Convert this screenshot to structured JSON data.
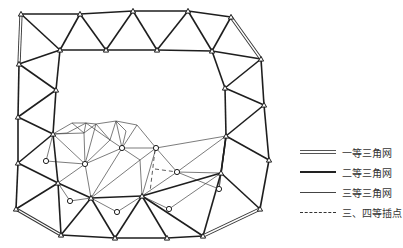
{
  "diagram": {
    "type": "triangulation network",
    "colors": {
      "line": "#222222",
      "background": "#ffffff"
    }
  },
  "legend": {
    "items": [
      {
        "key": "first",
        "label": "一等三角网",
        "style": "double"
      },
      {
        "key": "second",
        "label": "二等三角网",
        "style": "thick"
      },
      {
        "key": "third",
        "label": "三等三角网",
        "style": "thin"
      },
      {
        "key": "fourth",
        "label": "三、四等插点",
        "style": "dashed"
      }
    ]
  },
  "network": {
    "nodes": {
      "A": [
        21,
        14
      ],
      "B": [
        80,
        14
      ],
      "C": [
        133,
        11
      ],
      "D": [
        188,
        11
      ],
      "E": [
        231,
        17
      ],
      "F": [
        60,
        50
      ],
      "G": [
        106,
        50
      ],
      "H": [
        157,
        50
      ],
      "I": [
        212,
        51
      ],
      "J": [
        19,
        64
      ],
      "K": [
        261,
        59
      ],
      "L": [
        56,
        90
      ],
      "M": [
        225,
        88
      ],
      "N": [
        18,
        117
      ],
      "O": [
        264,
        105
      ],
      "P": [
        53,
        134
      ],
      "Q": [
        226,
        136
      ],
      "R": [
        18,
        163
      ],
      "S": [
        269,
        160
      ],
      "T": [
        58,
        183
      ],
      "U": [
        221,
        173
      ],
      "V": [
        91,
        198
      ],
      "W": [
        142,
        196
      ],
      "X": [
        16,
        209
      ],
      "Y": [
        260,
        209
      ],
      "Z": [
        61,
        235
      ],
      "AA": [
        115,
        238
      ],
      "AB": [
        167,
        238
      ],
      "AC": [
        203,
        236
      ],
      "f1": [
        72,
        123
      ],
      "f2": [
        86,
        123
      ],
      "f3": [
        96,
        124
      ],
      "f4": [
        116,
        121
      ],
      "f5": [
        137,
        125
      ],
      "f6": [
        84,
        133
      ],
      "f7": [
        85,
        164
      ],
      "f8": [
        122,
        148
      ],
      "f9": [
        156,
        148
      ],
      "f10": [
        177,
        172
      ],
      "f11": [
        67,
        133
      ],
      "f12": [
        126,
        131
      ],
      "f13": [
        110,
        140
      ],
      "f14": [
        140,
        160
      ]
    },
    "interpolated_points": {
      "c1": [
        46,
        161
      ],
      "c2": [
        70,
        201
      ],
      "c3": [
        117,
        212
      ],
      "c4": [
        169,
        209
      ],
      "c5": [
        219,
        189
      ],
      "c6": [
        177,
        172
      ],
      "c7": [
        122,
        148
      ],
      "c8": [
        85,
        164
      ],
      "c9": [
        156,
        148
      ]
    },
    "first_order_edges": [
      [
        "A",
        "J"
      ],
      [
        "E",
        "K"
      ],
      [
        "X",
        "Z"
      ],
      [
        "Y",
        "AC"
      ]
    ],
    "second_order_edges": [
      [
        "A",
        "B"
      ],
      [
        "B",
        "C"
      ],
      [
        "C",
        "D"
      ],
      [
        "D",
        "E"
      ],
      [
        "A",
        "F"
      ],
      [
        "B",
        "F"
      ],
      [
        "B",
        "G"
      ],
      [
        "C",
        "G"
      ],
      [
        "C",
        "H"
      ],
      [
        "D",
        "H"
      ],
      [
        "D",
        "I"
      ],
      [
        "E",
        "I"
      ],
      [
        "F",
        "G"
      ],
      [
        "G",
        "H"
      ],
      [
        "H",
        "I"
      ],
      [
        "I",
        "K"
      ],
      [
        "I",
        "M"
      ],
      [
        "K",
        "M"
      ],
      [
        "K",
        "O"
      ],
      [
        "M",
        "O"
      ],
      [
        "J",
        "F"
      ],
      [
        "F",
        "L"
      ],
      [
        "J",
        "L"
      ],
      [
        "J",
        "N"
      ],
      [
        "L",
        "N"
      ],
      [
        "L",
        "P"
      ],
      [
        "N",
        "P"
      ],
      [
        "N",
        "R"
      ],
      [
        "P",
        "R"
      ],
      [
        "M",
        "Q"
      ],
      [
        "O",
        "Q"
      ],
      [
        "O",
        "S"
      ],
      [
        "Q",
        "S"
      ],
      [
        "Q",
        "U"
      ],
      [
        "S",
        "Y"
      ],
      [
        "U",
        "Y"
      ],
      [
        "R",
        "T"
      ],
      [
        "P",
        "T"
      ],
      [
        "R",
        "X"
      ],
      [
        "T",
        "X"
      ],
      [
        "T",
        "Z"
      ],
      [
        "T",
        "V"
      ],
      [
        "V",
        "Z"
      ],
      [
        "V",
        "AA"
      ],
      [
        "Z",
        "AA"
      ],
      [
        "V",
        "W"
      ],
      [
        "W",
        "AA"
      ],
      [
        "W",
        "AB"
      ],
      [
        "AA",
        "AB"
      ],
      [
        "W",
        "U"
      ],
      [
        "U",
        "AC"
      ],
      [
        "AB",
        "AC"
      ],
      [
        "W",
        "AC"
      ],
      [
        "U",
        "Q"
      ]
    ],
    "third_order_edges": [
      [
        "P",
        "f1"
      ],
      [
        "f1",
        "f2"
      ],
      [
        "f2",
        "f3"
      ],
      [
        "f3",
        "f4"
      ],
      [
        "f4",
        "f5"
      ],
      [
        "f5",
        "f9"
      ],
      [
        "f9",
        "f10"
      ],
      [
        "f10",
        "Q"
      ],
      [
        "P",
        "f6"
      ],
      [
        "f1",
        "f6"
      ],
      [
        "f2",
        "f6"
      ],
      [
        "f6",
        "f3"
      ],
      [
        "f3",
        "f13"
      ],
      [
        "f6",
        "f7"
      ],
      [
        "P",
        "f7"
      ],
      [
        "P",
        "c1"
      ],
      [
        "c1",
        "f7"
      ],
      [
        "f7",
        "f13"
      ],
      [
        "f13",
        "f8"
      ],
      [
        "f4",
        "f8"
      ],
      [
        "f8",
        "f5"
      ],
      [
        "f8",
        "f9"
      ],
      [
        "f4",
        "f12"
      ],
      [
        "f12",
        "f8"
      ],
      [
        "f13",
        "f4"
      ],
      [
        "f7",
        "T"
      ],
      [
        "f7",
        "V"
      ],
      [
        "f8",
        "V"
      ],
      [
        "f8",
        "f14"
      ],
      [
        "f14",
        "V"
      ],
      [
        "f14",
        "W"
      ],
      [
        "f9",
        "W"
      ],
      [
        "f9",
        "f14"
      ],
      [
        "f10",
        "W"
      ],
      [
        "f10",
        "U"
      ],
      [
        "f9",
        "Q"
      ],
      [
        "T",
        "c2"
      ],
      [
        "c2",
        "V"
      ],
      [
        "V",
        "c3"
      ],
      [
        "c3",
        "W"
      ],
      [
        "W",
        "c4"
      ],
      [
        "c4",
        "U"
      ],
      [
        "U",
        "c5"
      ],
      [
        "c5",
        "Q"
      ],
      [
        "f10",
        "c5"
      ],
      [
        "P",
        "f11"
      ],
      [
        "f11",
        "f2"
      ],
      [
        "f7",
        "f8"
      ],
      [
        "f3",
        "f7"
      ],
      [
        "f2",
        "f13"
      ]
    ],
    "dashed_edges": [
      [
        [
          155,
          169
        ],
        [
          177,
          172
        ]
      ],
      [
        [
          155,
          150
        ],
        [
          150,
          192
        ]
      ]
    ]
  }
}
